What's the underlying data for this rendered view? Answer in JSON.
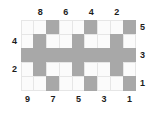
{
  "figure": {
    "title": "",
    "colors": {
      "filled": "#a8a8a8",
      "empty": "#fbfbfb",
      "border": "#e6e6e6",
      "label": "#1c1c1c",
      "background": "#ffffff"
    }
  },
  "chart_data": {
    "type": "heatmap",
    "title": "",
    "xlabel": "",
    "ylabel": "",
    "rows": 5,
    "cols": 9,
    "grid": [
      [
        0,
        0,
        1,
        0,
        0,
        1,
        0,
        0,
        1
      ],
      [
        0,
        1,
        0,
        0,
        1,
        0,
        0,
        1,
        0
      ],
      [
        1,
        1,
        1,
        1,
        1,
        1,
        1,
        1,
        1
      ],
      [
        0,
        1,
        0,
        0,
        1,
        0,
        0,
        1,
        0
      ],
      [
        0,
        0,
        1,
        0,
        0,
        1,
        0,
        0,
        1
      ]
    ],
    "legend": {
      "filled": "shaded cell",
      "empty": "blank cell"
    }
  },
  "axes": {
    "top": {
      "labels": [
        "",
        "8",
        "",
        "6",
        "",
        "4",
        "",
        "2",
        ""
      ],
      "columns": [
        2,
        4,
        6,
        8
      ],
      "values": [
        "8",
        "6",
        "4",
        "2"
      ]
    },
    "bottom": {
      "labels": [
        "9",
        "",
        "7",
        "",
        "5",
        "",
        "3",
        "",
        "1"
      ],
      "columns": [
        1,
        3,
        5,
        7,
        9
      ],
      "values": [
        "9",
        "7",
        "5",
        "3",
        "1"
      ]
    },
    "left": {
      "labels": [
        "",
        "4",
        "",
        "2",
        ""
      ],
      "rows": [
        2,
        4
      ],
      "values": [
        "4",
        "2"
      ]
    },
    "right": {
      "labels": [
        "5",
        "",
        "3",
        "",
        "1"
      ],
      "rows": [
        1,
        3,
        5
      ],
      "values": [
        "5",
        "3",
        "1"
      ]
    }
  }
}
